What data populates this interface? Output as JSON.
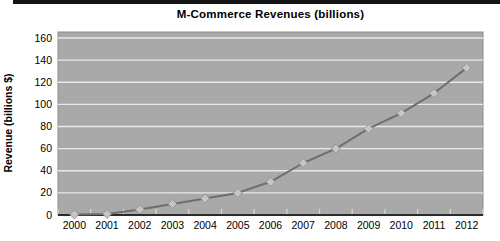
{
  "window": {
    "title": "M-Commerce Revenues chart"
  },
  "chart_data": {
    "type": "line",
    "title": "M-Commerce Revenues (billions)",
    "xlabel": "",
    "ylabel": "Revenue (billions $)",
    "categories": [
      "2000",
      "2001",
      "2002",
      "2003",
      "2004",
      "2005",
      "2006",
      "2007",
      "2008",
      "2009",
      "2010",
      "2011",
      "2012"
    ],
    "series": [
      {
        "name": "M-Commerce Revenues",
        "values": [
          0.5,
          1,
          5,
          10,
          15,
          20,
          30,
          47,
          60,
          78,
          92,
          110,
          133
        ]
      }
    ],
    "ylim": [
      0,
      160
    ],
    "yticks": [
      0,
      20,
      40,
      60,
      80,
      100,
      120,
      140,
      160
    ],
    "grid": "horizontal",
    "legend": "none",
    "marker": "diamond"
  },
  "style": {
    "plot_bg": "#a9a9a9",
    "plot_border": "#8c8c8c",
    "gridline": "#e9e9e9",
    "tick_mark": "#d9d9d9",
    "axis_line": "#2b2b2b",
    "line_color": "#6e6e6e",
    "marker_fill": "#c6c6c6",
    "marker_edge": "#8a8a8a",
    "text_color": "#000000",
    "top_rule": "#141414"
  }
}
